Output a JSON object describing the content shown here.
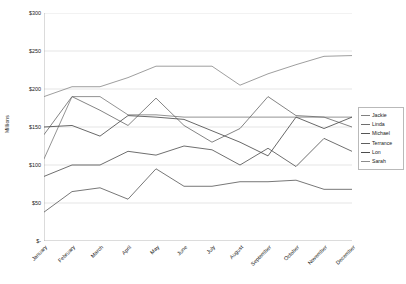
{
  "chart_data": {
    "type": "line",
    "title": "",
    "xlabel": "",
    "ylabel": "Millions",
    "ylim": [
      0,
      300
    ],
    "ytick_values": [
      0,
      50,
      100,
      150,
      200,
      250,
      300
    ],
    "ytick_labels": [
      "$-",
      "$50",
      "$100",
      "$150",
      "$200",
      "$250",
      "$300"
    ],
    "grid": "horizontal",
    "legend_position": "right",
    "categories": [
      "January",
      "February",
      "March",
      "April",
      "May",
      "June",
      "July",
      "August",
      "September",
      "October",
      "November",
      "December"
    ],
    "series": [
      {
        "name": "Jackie",
        "color": "#808080",
        "values": [
          108,
          190,
          190,
          166,
          166,
          163,
          163,
          163,
          163,
          163,
          163,
          163
        ]
      },
      {
        "name": "Linda",
        "color": "#6e6e6e",
        "values": [
          140,
          190,
          172,
          152,
          188,
          152,
          130,
          148,
          190,
          165,
          163,
          150
        ]
      },
      {
        "name": "Michael",
        "color": "#555555",
        "values": [
          85,
          100,
          100,
          118,
          113,
          125,
          120,
          100,
          122,
          98,
          135,
          118
        ]
      },
      {
        "name": "Terrance",
        "color": "#5f5f5f",
        "values": [
          38,
          65,
          70,
          55,
          95,
          72,
          72,
          78,
          78,
          80,
          68,
          68
        ]
      },
      {
        "name": "Lon",
        "color": "#4d4d4d",
        "values": [
          150,
          152,
          138,
          165,
          163,
          160,
          145,
          130,
          112,
          163,
          148,
          163
        ]
      },
      {
        "name": "Sarah",
        "color": "#8c8c8c",
        "values": [
          190,
          203,
          203,
          215,
          230,
          230,
          230,
          205,
          220,
          232,
          243,
          244
        ]
      }
    ]
  },
  "axis": {
    "axis_line_color": "#a6a6a6",
    "grid_color": "#d4d4d4"
  },
  "legend": {
    "entries": [
      "Jackie",
      "Linda",
      "Michael",
      "Terrance",
      "Lon",
      "Sarah"
    ]
  }
}
